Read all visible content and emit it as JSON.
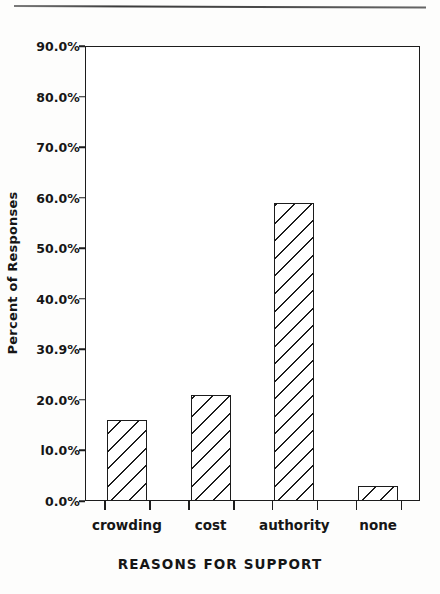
{
  "figure": {
    "background_color": "#fdfdfc",
    "ink_color": "#1c1c1c",
    "top_rule": "horizontal-rule"
  },
  "chart_data": {
    "type": "bar",
    "title": "",
    "xlabel": "REASONS FOR SUPPORT",
    "ylabel": "Percent of Responses",
    "categories": [
      "crowding",
      "cost",
      "authority",
      "none"
    ],
    "values": [
      16.0,
      21.0,
      59.0,
      3.0
    ],
    "ylim": [
      0,
      90
    ],
    "ytick_values": [
      0,
      10,
      20,
      30,
      40,
      50,
      60,
      70,
      80,
      90
    ],
    "ytick_labels": [
      "0.0%",
      "l0.0%",
      "20.0%",
      "30.9%",
      "40.0%",
      "50.0%",
      "60.0%",
      "70.0%",
      "80.0%",
      "90.0%"
    ],
    "grid": false,
    "legend": null,
    "bar_style": {
      "fill": "#ffffff",
      "hatch": "diagonal",
      "edge_color": "#1c1c1c"
    }
  }
}
